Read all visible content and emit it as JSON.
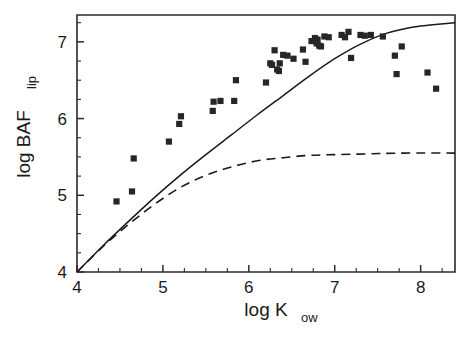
{
  "chart_data": {
    "type": "scatter",
    "title": "",
    "xlabel": "log K_ow",
    "xlabel_main": "log K",
    "xlabel_sub": "ow",
    "ylabel": "log BAF_lip",
    "ylabel_main": "log BAF",
    "ylabel_sub": "lip",
    "xlim": [
      4,
      8.4
    ],
    "ylim": [
      4,
      7.35
    ],
    "xticks": [
      4,
      5,
      6,
      7,
      8
    ],
    "xtick_labels": [
      "4",
      "5",
      "6",
      "7",
      "8"
    ],
    "yticks": [
      4,
      5,
      6,
      7
    ],
    "ytick_labels": [
      "4",
      "5",
      "6",
      "7"
    ],
    "x_minor_step": 0.25,
    "y_minor_step": 0.25,
    "grid": false,
    "legend": null,
    "legend_position": "none",
    "marker_style": "filled-square",
    "marker_color": "#262626",
    "line_color": "#1a1a1a",
    "series": [
      {
        "name": "observed data",
        "type": "scatter",
        "points": [
          [
            4.46,
            4.92
          ],
          [
            4.64,
            5.05
          ],
          [
            4.66,
            5.48
          ],
          [
            5.07,
            5.7
          ],
          [
            5.19,
            5.93
          ],
          [
            5.21,
            6.03
          ],
          [
            5.58,
            6.1
          ],
          [
            5.59,
            6.22
          ],
          [
            5.67,
            6.23
          ],
          [
            5.83,
            6.23
          ],
          [
            5.85,
            6.5
          ],
          [
            6.2,
            6.47
          ],
          [
            6.25,
            6.72
          ],
          [
            6.27,
            6.7
          ],
          [
            6.3,
            6.89
          ],
          [
            6.33,
            6.64
          ],
          [
            6.35,
            6.62
          ],
          [
            6.36,
            6.72
          ],
          [
            6.4,
            6.83
          ],
          [
            6.45,
            6.82
          ],
          [
            6.52,
            6.78
          ],
          [
            6.63,
            6.9
          ],
          [
            6.66,
            6.74
          ],
          [
            6.73,
            7.01
          ],
          [
            6.77,
            7.05
          ],
          [
            6.79,
            6.98
          ],
          [
            6.8,
            7.03
          ],
          [
            6.82,
            6.95
          ],
          [
            6.84,
            6.94
          ],
          [
            6.88,
            7.07
          ],
          [
            6.93,
            7.06
          ],
          [
            7.08,
            7.09
          ],
          [
            7.12,
            7.06
          ],
          [
            7.16,
            7.13
          ],
          [
            7.19,
            6.79
          ],
          [
            7.3,
            7.09
          ],
          [
            7.35,
            7.08
          ],
          [
            7.42,
            7.09
          ],
          [
            7.56,
            7.07
          ],
          [
            7.7,
            6.82
          ],
          [
            7.72,
            6.58
          ],
          [
            7.78,
            6.94
          ],
          [
            8.08,
            6.6
          ],
          [
            8.18,
            6.39
          ]
        ]
      },
      {
        "name": "model curve (solid)",
        "type": "line",
        "style": "solid",
        "points": [
          [
            4.0,
            4.0
          ],
          [
            4.3,
            4.34
          ],
          [
            4.6,
            4.66
          ],
          [
            4.9,
            4.97
          ],
          [
            5.2,
            5.26
          ],
          [
            5.5,
            5.53
          ],
          [
            5.8,
            5.79
          ],
          [
            6.1,
            6.05
          ],
          [
            6.4,
            6.3
          ],
          [
            6.7,
            6.55
          ],
          [
            7.0,
            6.78
          ],
          [
            7.3,
            6.97
          ],
          [
            7.6,
            7.11
          ],
          [
            7.9,
            7.19
          ],
          [
            8.2,
            7.23
          ],
          [
            8.4,
            7.25
          ]
        ]
      },
      {
        "name": "model curve (dashed)",
        "type": "line",
        "style": "dashed",
        "points": [
          [
            4.0,
            4.0
          ],
          [
            4.3,
            4.33
          ],
          [
            4.6,
            4.62
          ],
          [
            4.9,
            4.88
          ],
          [
            5.2,
            5.1
          ],
          [
            5.5,
            5.26
          ],
          [
            5.8,
            5.37
          ],
          [
            6.1,
            5.45
          ],
          [
            6.4,
            5.49
          ],
          [
            6.7,
            5.52
          ],
          [
            7.0,
            5.53
          ],
          [
            7.4,
            5.54
          ],
          [
            7.8,
            5.55
          ],
          [
            8.4,
            5.55
          ]
        ]
      }
    ]
  },
  "figure": {
    "background_color": "#ffffff",
    "frame_color": "#2b2b2b",
    "accent_color": "#1a1a1a"
  }
}
